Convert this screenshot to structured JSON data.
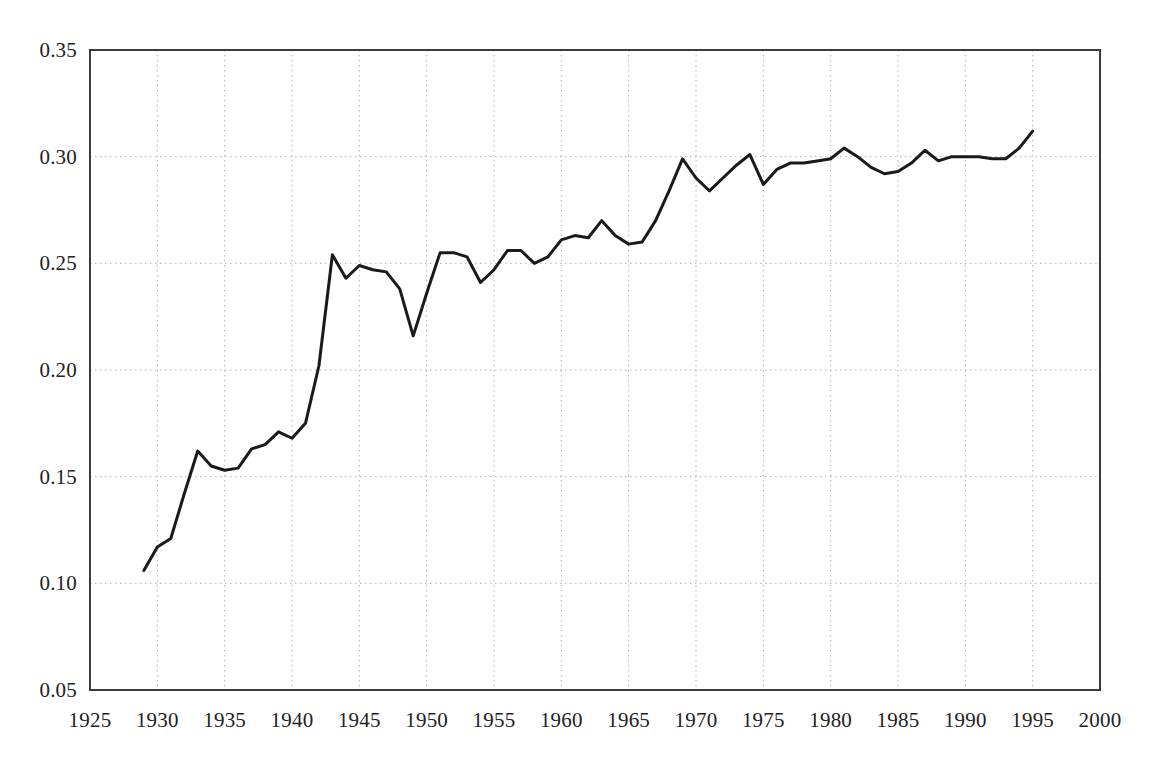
{
  "chart_data": {
    "type": "line",
    "title": "",
    "subtitle": "",
    "xlabel": "",
    "ylabel": "",
    "xlim": [
      1925,
      2000
    ],
    "ylim": [
      0.05,
      0.35
    ],
    "xticks": [
      1925,
      1930,
      1935,
      1940,
      1945,
      1950,
      1955,
      1960,
      1965,
      1970,
      1975,
      1980,
      1985,
      1990,
      1995,
      2000
    ],
    "xtick_labels": [
      "1925",
      "1930",
      "1935",
      "1940",
      "1945",
      "1950",
      "1955",
      "1960",
      "1965",
      "1970",
      "1975",
      "1980",
      "1985",
      "1990",
      "1995",
      "2000"
    ],
    "yticks": [
      0.05,
      0.1,
      0.15,
      0.2,
      0.25,
      0.3,
      0.35
    ],
    "ytick_labels": [
      "0.05",
      "0.10",
      "0.15",
      "0.20",
      "0.25",
      "0.30",
      "0.35"
    ],
    "grid": true,
    "grid_style": "dotted",
    "grid_color": "#b0b0b0",
    "frame_color": "#3c3c3c",
    "legend": null,
    "legend_position": "none",
    "annotations": [],
    "series": [
      {
        "name": "series-1",
        "color": "#1a1a1a",
        "line_width": 3,
        "x": [
          1929,
          1930,
          1931,
          1932,
          1933,
          1934,
          1935,
          1936,
          1937,
          1938,
          1939,
          1940,
          1941,
          1942,
          1943,
          1944,
          1945,
          1946,
          1947,
          1948,
          1949,
          1950,
          1951,
          1952,
          1953,
          1954,
          1955,
          1956,
          1957,
          1958,
          1959,
          1960,
          1961,
          1962,
          1963,
          1964,
          1965,
          1966,
          1967,
          1968,
          1969,
          1970,
          1971,
          1972,
          1973,
          1974,
          1975,
          1976,
          1977,
          1978,
          1979,
          1980,
          1981,
          1982,
          1983,
          1984,
          1985,
          1986,
          1987,
          1988,
          1989,
          1990,
          1991,
          1992,
          1993,
          1994,
          1995
        ],
        "y": [
          0.106,
          0.117,
          0.121,
          0.142,
          0.162,
          0.155,
          0.153,
          0.154,
          0.163,
          0.165,
          0.171,
          0.168,
          0.175,
          0.202,
          0.254,
          0.243,
          0.249,
          0.247,
          0.246,
          0.238,
          0.216,
          0.236,
          0.255,
          0.255,
          0.253,
          0.241,
          0.247,
          0.256,
          0.256,
          0.25,
          0.253,
          0.261,
          0.263,
          0.262,
          0.27,
          0.263,
          0.259,
          0.26,
          0.27,
          0.284,
          0.299,
          0.29,
          0.284,
          0.29,
          0.296,
          0.301,
          0.287,
          0.294,
          0.297,
          0.297,
          0.298,
          0.299,
          0.304,
          0.3,
          0.295,
          0.292,
          0.293,
          0.297,
          0.303,
          0.298,
          0.3,
          0.3,
          0.3,
          0.299,
          0.299,
          0.304,
          0.312
        ]
      }
    ]
  },
  "axes": {
    "plot_left": 90,
    "plot_right": 1100,
    "plot_top": 50,
    "plot_bottom": 690
  }
}
